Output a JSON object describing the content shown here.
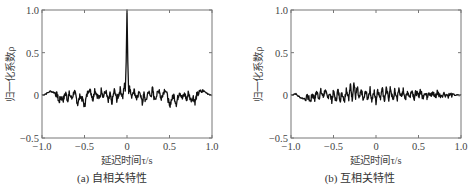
{
  "chart_data": [
    {
      "type": "line",
      "caption": "(a) 自相关特性",
      "title": "",
      "xlabel": "延迟时间τ/s",
      "ylabel": "归一化系数ρ",
      "xlim": [
        -1.0,
        1.0
      ],
      "ylim": [
        -0.5,
        1.0
      ],
      "xticks": [
        "−1.0",
        "−0.5",
        "0",
        "0.5",
        "1.0"
      ],
      "yticks": [
        "−0.5",
        "0",
        "0.5",
        "1.0"
      ],
      "grid": false,
      "legend": null,
      "series": [
        {
          "name": "autocorrelation",
          "x": [
            -1.0,
            -0.95,
            -0.9,
            -0.85,
            -0.82,
            -0.8,
            -0.78,
            -0.75,
            -0.72,
            -0.7,
            -0.68,
            -0.65,
            -0.62,
            -0.6,
            -0.58,
            -0.55,
            -0.52,
            -0.5,
            -0.48,
            -0.45,
            -0.42,
            -0.4,
            -0.38,
            -0.35,
            -0.32,
            -0.3,
            -0.28,
            -0.25,
            -0.22,
            -0.2,
            -0.18,
            -0.15,
            -0.12,
            -0.1,
            -0.08,
            -0.05,
            -0.03,
            -0.02,
            -0.01,
            0.0,
            0.01,
            0.02,
            0.03,
            0.05,
            0.08,
            0.1,
            0.12,
            0.15,
            0.18,
            0.2,
            0.22,
            0.25,
            0.28,
            0.3,
            0.32,
            0.35,
            0.38,
            0.4,
            0.42,
            0.45,
            0.48,
            0.5,
            0.52,
            0.55,
            0.58,
            0.6,
            0.62,
            0.65,
            0.68,
            0.7,
            0.72,
            0.75,
            0.78,
            0.8,
            0.82,
            0.85,
            0.9,
            0.95,
            1.0
          ],
          "y": [
            0.0,
            0.02,
            0.05,
            0.03,
            0.0,
            -0.08,
            -0.02,
            -0.05,
            0.03,
            -0.06,
            0.02,
            -0.04,
            0.05,
            -0.02,
            -0.1,
            0.0,
            -0.06,
            -0.13,
            -0.03,
            0.08,
            0.02,
            -0.05,
            0.07,
            0.0,
            -0.04,
            0.08,
            -0.02,
            0.05,
            -0.08,
            0.02,
            -0.1,
            0.06,
            -0.05,
            0.0,
            0.07,
            -0.02,
            0.12,
            0.05,
            0.4,
            1.0,
            0.4,
            0.05,
            0.12,
            -0.02,
            0.07,
            0.0,
            -0.05,
            0.06,
            -0.1,
            0.02,
            -0.08,
            0.05,
            -0.02,
            0.08,
            -0.04,
            0.0,
            0.07,
            -0.05,
            0.02,
            0.08,
            -0.03,
            -0.13,
            -0.06,
            0.0,
            -0.1,
            -0.02,
            0.05,
            -0.04,
            0.02,
            -0.06,
            0.03,
            -0.05,
            -0.02,
            -0.08,
            0.0,
            0.03,
            0.05,
            0.02,
            0.0
          ]
        }
      ]
    },
    {
      "type": "line",
      "caption": "(b) 互相关特性",
      "title": "",
      "xlabel": "延迟时间τ/s",
      "ylabel": "归一化系数ρ",
      "xlim": [
        -1.0,
        1.0
      ],
      "ylim": [
        -0.5,
        1.0
      ],
      "xticks": [
        "−1.0",
        "−0.5",
        "0",
        "0.5",
        "1.0"
      ],
      "yticks": [
        "−0.5",
        "0",
        "0.5",
        "1.0"
      ],
      "grid": false,
      "legend": null,
      "series": [
        {
          "name": "cross-correlation",
          "x": [
            -1.0,
            -0.95,
            -0.9,
            -0.85,
            -0.8,
            -0.77,
            -0.75,
            -0.72,
            -0.7,
            -0.67,
            -0.65,
            -0.62,
            -0.6,
            -0.57,
            -0.55,
            -0.52,
            -0.5,
            -0.47,
            -0.45,
            -0.42,
            -0.4,
            -0.37,
            -0.35,
            -0.32,
            -0.3,
            -0.28,
            -0.26,
            -0.24,
            -0.22,
            -0.2,
            -0.17,
            -0.15,
            -0.12,
            -0.1,
            -0.07,
            -0.05,
            -0.02,
            0.0,
            0.02,
            0.05,
            0.07,
            0.1,
            0.12,
            0.15,
            0.17,
            0.2,
            0.22,
            0.25,
            0.27,
            0.3,
            0.32,
            0.35,
            0.37,
            0.4,
            0.42,
            0.45,
            0.47,
            0.5,
            0.52,
            0.55,
            0.57,
            0.6,
            0.62,
            0.65,
            0.67,
            0.7,
            0.72,
            0.75,
            0.8,
            0.85,
            0.9,
            0.95,
            1.0
          ],
          "y": [
            0.0,
            0.02,
            -0.02,
            -0.04,
            -0.02,
            -0.07,
            0.01,
            -0.04,
            0.04,
            -0.03,
            0.05,
            -0.02,
            0.06,
            -0.04,
            0.03,
            -0.06,
            0.04,
            -0.07,
            0.06,
            -0.05,
            0.03,
            -0.06,
            0.08,
            -0.03,
            0.12,
            -0.04,
            0.15,
            -0.02,
            0.09,
            -0.05,
            0.06,
            -0.07,
            0.05,
            -0.04,
            0.07,
            -0.06,
            0.04,
            -0.08,
            0.08,
            -0.05,
            0.1,
            -0.06,
            0.07,
            -0.04,
            0.09,
            -0.07,
            0.05,
            -0.04,
            0.08,
            -0.03,
            0.06,
            -0.04,
            0.05,
            -0.02,
            0.07,
            -0.03,
            0.04,
            -0.02,
            0.06,
            -0.03,
            0.04,
            -0.02,
            0.05,
            -0.01,
            0.03,
            -0.02,
            0.04,
            0.0,
            0.02,
            0.0,
            0.01,
            0.0,
            0.0
          ]
        }
      ]
    }
  ]
}
